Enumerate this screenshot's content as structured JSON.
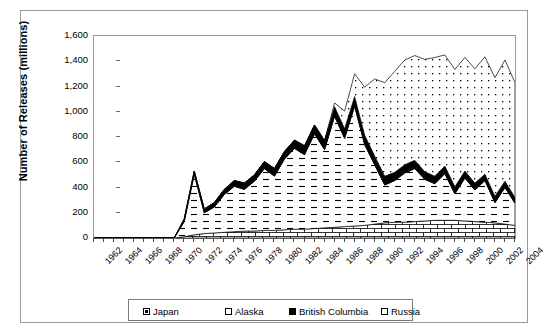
{
  "chart_data": {
    "type": "area",
    "stacked": true,
    "title": "",
    "xlabel": "",
    "ylabel": "Number of Releases (millions)",
    "ylim": [
      0,
      1600
    ],
    "ytick_values": [
      0,
      200,
      400,
      600,
      800,
      1000,
      1200,
      1400,
      1600
    ],
    "ytick_labels": [
      "0",
      "200",
      "400",
      "600",
      "800",
      "1,000",
      "1,200",
      "1,400",
      "1,600"
    ],
    "xlim": [
      1962,
      2004
    ],
    "xtick_labels": [
      "1962",
      "1964",
      "1966",
      "1968",
      "1970",
      "1972",
      "1974",
      "1976",
      "1978",
      "1980",
      "1982",
      "1984",
      "1986",
      "1988",
      "1990",
      "1992",
      "1994",
      "1996",
      "1998",
      "2000",
      "2002",
      "2004"
    ],
    "xtick_step": 2,
    "grid": false,
    "legend_position": "bottom",
    "x": [
      1962,
      1963,
      1964,
      1965,
      1966,
      1967,
      1968,
      1969,
      1970,
      1971,
      1972,
      1973,
      1974,
      1975,
      1976,
      1977,
      1978,
      1979,
      1980,
      1981,
      1982,
      1983,
      1984,
      1985,
      1986,
      1987,
      1988,
      1989,
      1990,
      1991,
      1992,
      1993,
      1994,
      1995,
      1996,
      1997,
      1998,
      1999,
      2000,
      2001,
      2002,
      2003,
      2004
    ],
    "series": [
      {
        "name": "Japan",
        "pattern": "brick",
        "values": [
          0,
          0,
          0,
          0,
          0,
          0,
          0,
          0,
          0,
          10,
          25,
          35,
          40,
          45,
          50,
          55,
          55,
          60,
          60,
          65,
          70,
          70,
          75,
          80,
          85,
          90,
          95,
          100,
          110,
          120,
          125,
          125,
          130,
          135,
          140,
          140,
          140,
          135,
          130,
          125,
          120,
          110,
          100
        ]
      },
      {
        "name": "Alaska",
        "pattern": "dashes",
        "values": [
          0,
          0,
          0,
          0,
          0,
          0,
          0,
          0,
          0,
          120,
          480,
          165,
          205,
          300,
          360,
          330,
          395,
          490,
          430,
          560,
          640,
          590,
          750,
          620,
          880,
          700,
          950,
          640,
          470,
          300,
          330,
          390,
          420,
          330,
          290,
          370,
          210,
          340,
          250,
          330,
          160,
          290,
          175
        ]
      },
      {
        "name": "British Columbia",
        "pattern": "solid-black",
        "values": [
          0,
          0,
          0,
          0,
          0,
          0,
          0,
          0,
          0,
          20,
          25,
          30,
          35,
          40,
          45,
          50,
          50,
          55,
          60,
          60,
          65,
          70,
          70,
          70,
          75,
          75,
          75,
          75,
          70,
          70,
          65,
          65,
          65,
          60,
          60,
          60,
          55,
          55,
          55,
          50,
          50,
          50,
          45
        ]
      },
      {
        "name": "Russia",
        "pattern": "dots",
        "values": [
          0,
          0,
          0,
          0,
          0,
          0,
          0,
          0,
          0,
          0,
          0,
          0,
          0,
          0,
          0,
          0,
          0,
          0,
          0,
          0,
          0,
          0,
          0,
          0,
          30,
          140,
          180,
          380,
          610,
          740,
          800,
          830,
          830,
          890,
          940,
          880,
          930,
          900,
          905,
          930,
          940,
          960,
          910
        ]
      }
    ],
    "totals": [
      0,
      0,
      0,
      0,
      0,
      0,
      0,
      0,
      0,
      150,
      530,
      230,
      280,
      385,
      455,
      435,
      500,
      705,
      550,
      685,
      775,
      730,
      895,
      770,
      1070,
      1005,
      1300,
      1195,
      1260,
      1230,
      1320,
      1410,
      1445,
      1415,
      1430,
      1450,
      1335,
      1430,
      1340,
      1435,
      1270,
      1410,
      1230
    ]
  },
  "legend": {
    "items": [
      {
        "label": "Japan",
        "swatch": "swatch-inner"
      },
      {
        "label": "Alaska",
        "swatch": "swatch-open"
      },
      {
        "label": "British Columbia",
        "swatch": "swatch-solid"
      },
      {
        "label": "Russia",
        "swatch": "swatch-open"
      }
    ]
  }
}
